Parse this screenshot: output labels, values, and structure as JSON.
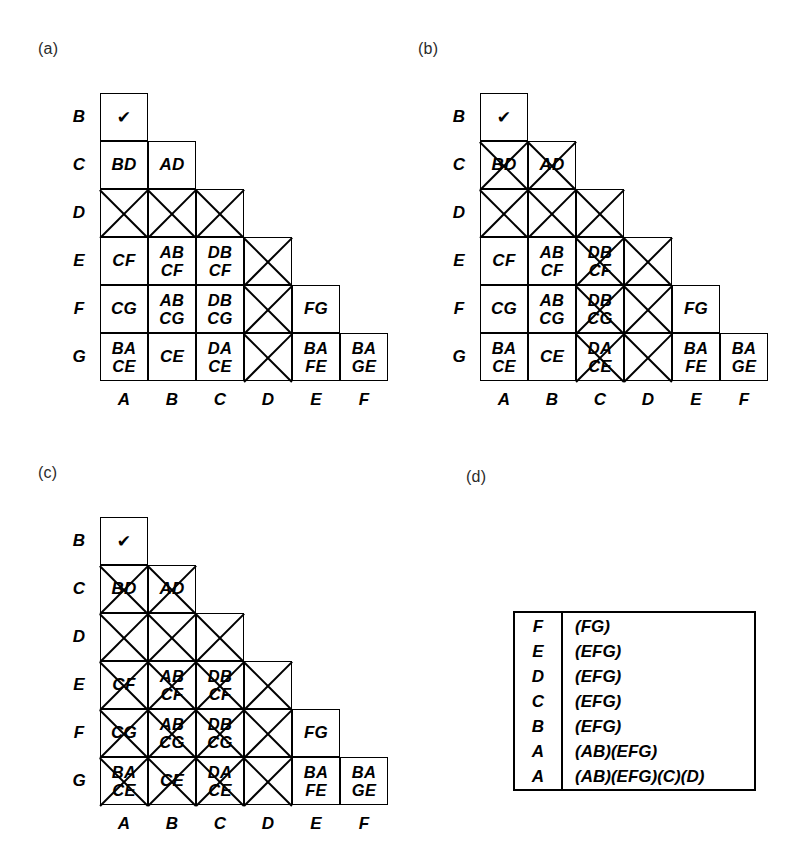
{
  "figure": {
    "panels": [
      {
        "id": "a",
        "label": "(a)"
      },
      {
        "id": "b",
        "label": "(b)"
      },
      {
        "id": "c",
        "label": "(c)"
      },
      {
        "id": "d",
        "label": "(d)"
      }
    ]
  },
  "matrix": {
    "row_labels": [
      "B",
      "C",
      "D",
      "E",
      "F",
      "G"
    ],
    "col_labels": [
      "A",
      "B",
      "C",
      "D",
      "E",
      "F"
    ],
    "check_glyph": "✔",
    "cells": [
      [
        {
          "lines": [
            "✔"
          ],
          "check": true
        }
      ],
      [
        {
          "lines": [
            "BD"
          ]
        },
        {
          "lines": [
            "AD"
          ]
        }
      ],
      [
        {
          "lines": []
        },
        {
          "lines": []
        },
        {
          "lines": []
        }
      ],
      [
        {
          "lines": [
            "CF"
          ]
        },
        {
          "lines": [
            "AB",
            "CF"
          ]
        },
        {
          "lines": [
            "DB",
            "CF"
          ]
        },
        {
          "lines": []
        }
      ],
      [
        {
          "lines": [
            "CG"
          ]
        },
        {
          "lines": [
            "AB",
            "CG"
          ]
        },
        {
          "lines": [
            "DB",
            "CG"
          ]
        },
        {
          "lines": []
        },
        {
          "lines": [
            "FG"
          ]
        }
      ],
      [
        {
          "lines": [
            "BA",
            "CE"
          ]
        },
        {
          "lines": [
            "CE"
          ]
        },
        {
          "lines": [
            "DA",
            "CE"
          ]
        },
        {
          "lines": []
        },
        {
          "lines": [
            "BA",
            "FE"
          ]
        },
        {
          "lines": [
            "BA",
            "GE"
          ]
        }
      ]
    ],
    "crosses": {
      "a": [
        [],
        [],
        [
          0,
          1,
          2
        ],
        [
          3
        ],
        [
          3
        ],
        [
          3
        ]
      ],
      "b": [
        [],
        [
          0,
          1
        ],
        [
          0,
          1,
          2
        ],
        [
          2,
          3
        ],
        [
          2,
          3
        ],
        [
          2,
          3
        ]
      ],
      "c": [
        [],
        [
          0,
          1
        ],
        [
          0,
          1,
          2
        ],
        [
          0,
          1,
          2,
          3
        ],
        [
          0,
          1,
          2,
          3
        ],
        [
          0,
          1,
          2,
          3
        ]
      ]
    }
  },
  "panel_d": {
    "rows": [
      {
        "key": "F",
        "value": "(FG)"
      },
      {
        "key": "E",
        "value": "(EFG)"
      },
      {
        "key": "D",
        "value": "(EFG)"
      },
      {
        "key": "C",
        "value": "(EFG)"
      },
      {
        "key": "B",
        "value": "(EFG)"
      },
      {
        "key": "A",
        "value": "(AB)(EFG)"
      },
      {
        "key": "A",
        "value": "(AB)(EFG)(C)(D)"
      }
    ]
  },
  "colors": {
    "ink": "#000000",
    "label_ink": "#2b2b2b",
    "paper": "#ffffff"
  }
}
